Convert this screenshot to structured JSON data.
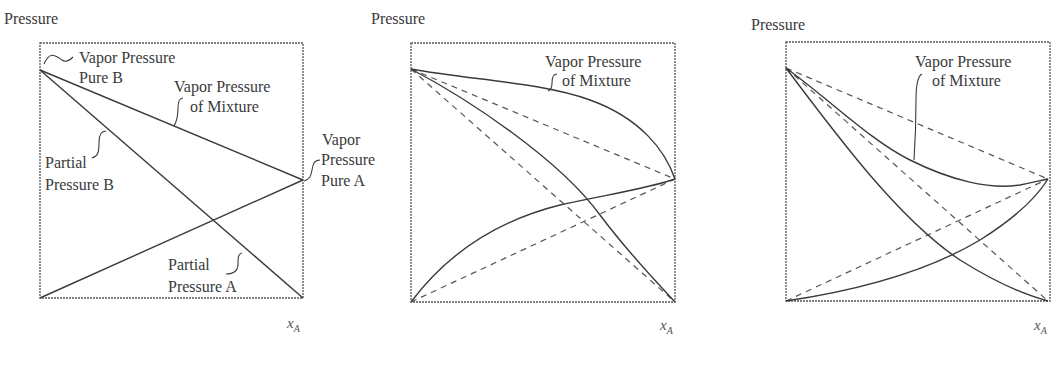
{
  "figure": {
    "panels": [
      {
        "id": "ideal",
        "y_axis_label": "Pressure",
        "x_axis_label": "x",
        "x_axis_subscript": "A",
        "labels": {
          "vp_pure_b_1": "Vapor Pressure",
          "vp_pure_b_2": "Pure B",
          "vp_mix_1": "Vapor Pressure",
          "vp_mix_2": "of Mixture",
          "pp_b_1": "Partial",
          "pp_b_2": "Pressure B",
          "vp_pure_a_1": "Vapor",
          "vp_pure_a_2": "Pressure",
          "vp_pure_a_3": "Pure A",
          "pp_a_1": "Partial",
          "pp_a_2": "Pressure A"
        }
      },
      {
        "id": "positive-deviation",
        "y_axis_label": "Pressure",
        "x_axis_label": "x",
        "x_axis_subscript": "A",
        "labels": {
          "vp_mix_1": "Vapor Pressure",
          "vp_mix_2": "of Mixture"
        }
      },
      {
        "id": "negative-deviation",
        "y_axis_label": "Pressure",
        "x_axis_label": "x",
        "x_axis_subscript": "A",
        "labels": {
          "vp_mix_1": "Vapor Pressure",
          "vp_mix_2": "of Mixture"
        }
      }
    ]
  },
  "colors": {
    "line": "#3a3a3a",
    "frame": "#555555",
    "background": "#ffffff"
  }
}
